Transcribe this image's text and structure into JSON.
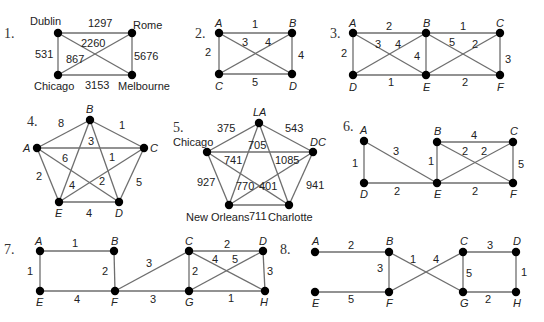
{
  "graphs": [
    {
      "number": "1.",
      "vertices": [
        {
          "id": "Dublin",
          "label": "Dublin",
          "x": 58,
          "y": 33,
          "lx": 30,
          "ly": 25
        },
        {
          "id": "Rome",
          "label": "Rome",
          "x": 132,
          "y": 33,
          "lx": 133,
          "ly": 29
        },
        {
          "id": "Chicago",
          "label": "Chicago",
          "x": 58,
          "y": 75,
          "lx": 34,
          "ly": 90
        },
        {
          "id": "Melbourne",
          "label": "Melbourne",
          "x": 132,
          "y": 75,
          "lx": 118,
          "ly": 90
        }
      ],
      "edges": [
        {
          "from": "Dublin",
          "to": "Rome",
          "weight": "1297",
          "lx": 88,
          "ly": 27
        },
        {
          "from": "Dublin",
          "to": "Chicago",
          "weight": "531",
          "lx": 35,
          "ly": 58
        },
        {
          "from": "Rome",
          "to": "Melbourne",
          "weight": "5676",
          "lx": 134,
          "ly": 60
        },
        {
          "from": "Chicago",
          "to": "Melbourne",
          "weight": "3153",
          "lx": 85,
          "ly": 89
        },
        {
          "from": "Dublin",
          "to": "Melbourne",
          "weight": "2260",
          "lx": 81,
          "ly": 47
        },
        {
          "from": "Rome",
          "to": "Chicago",
          "weight": "867",
          "lx": 66,
          "ly": 63
        }
      ]
    },
    {
      "number": "2.",
      "vertices": [
        {
          "id": "A",
          "label": "A",
          "x": 219,
          "y": 33,
          "lx": 215,
          "ly": 27
        },
        {
          "id": "B",
          "label": "B",
          "x": 292,
          "y": 33,
          "lx": 289,
          "ly": 27
        },
        {
          "id": "C",
          "label": "C",
          "x": 219,
          "y": 74,
          "lx": 215,
          "ly": 90
        },
        {
          "id": "D",
          "label": "D",
          "x": 292,
          "y": 74,
          "lx": 289,
          "ly": 90
        }
      ],
      "edges": [
        {
          "from": "A",
          "to": "B",
          "weight": "1",
          "lx": 252,
          "ly": 28
        },
        {
          "from": "A",
          "to": "C",
          "weight": "2",
          "lx": 205,
          "ly": 56
        },
        {
          "from": "B",
          "to": "D",
          "weight": "4",
          "lx": 298,
          "ly": 59
        },
        {
          "from": "C",
          "to": "D",
          "weight": "5",
          "lx": 252,
          "ly": 86
        },
        {
          "from": "A",
          "to": "D",
          "weight": "3",
          "lx": 242,
          "ly": 46
        },
        {
          "from": "B",
          "to": "C",
          "weight": "4",
          "lx": 265,
          "ly": 46
        }
      ]
    },
    {
      "number": "3.",
      "vertices": [
        {
          "id": "A",
          "label": "A",
          "x": 353,
          "y": 33,
          "lx": 349,
          "ly": 27
        },
        {
          "id": "B",
          "label": "B",
          "x": 426,
          "y": 33,
          "lx": 423,
          "ly": 27
        },
        {
          "id": "C",
          "label": "C",
          "x": 500,
          "y": 33,
          "lx": 496,
          "ly": 27
        },
        {
          "id": "D",
          "label": "D",
          "x": 353,
          "y": 75,
          "lx": 349,
          "ly": 91
        },
        {
          "id": "E",
          "label": "E",
          "x": 426,
          "y": 75,
          "lx": 423,
          "ly": 91
        },
        {
          "id": "F",
          "label": "F",
          "x": 500,
          "y": 75,
          "lx": 497,
          "ly": 91
        }
      ],
      "edges": [
        {
          "from": "A",
          "to": "B",
          "weight": "2",
          "lx": 386,
          "ly": 30
        },
        {
          "from": "B",
          "to": "C",
          "weight": "1",
          "lx": 460,
          "ly": 30
        },
        {
          "from": "A",
          "to": "D",
          "weight": "2",
          "lx": 341,
          "ly": 57
        },
        {
          "from": "B",
          "to": "E",
          "weight": "4",
          "lx": 414,
          "ly": 60
        },
        {
          "from": "C",
          "to": "F",
          "weight": "3",
          "lx": 505,
          "ly": 63
        },
        {
          "from": "D",
          "to": "E",
          "weight": "1",
          "lx": 388,
          "ly": 86
        },
        {
          "from": "E",
          "to": "F",
          "weight": "2",
          "lx": 462,
          "ly": 86
        },
        {
          "from": "A",
          "to": "E",
          "weight": "3",
          "lx": 375,
          "ly": 48
        },
        {
          "from": "D",
          "to": "B",
          "weight": "4",
          "lx": 395,
          "ly": 48
        },
        {
          "from": "B",
          "to": "F",
          "weight": "5",
          "lx": 449,
          "ly": 46
        },
        {
          "from": "E",
          "to": "C",
          "weight": "2",
          "lx": 472,
          "ly": 48
        }
      ]
    },
    {
      "number": "4.",
      "vertices": [
        {
          "id": "B",
          "label": "B",
          "x": 90,
          "y": 120,
          "lx": 86,
          "ly": 113
        },
        {
          "id": "A",
          "label": "A",
          "x": 37,
          "y": 148,
          "lx": 23,
          "ly": 152
        },
        {
          "id": "C",
          "label": "C",
          "x": 144,
          "y": 148,
          "lx": 150,
          "ly": 152
        },
        {
          "id": "E",
          "label": "E",
          "x": 59,
          "y": 202,
          "lx": 55,
          "ly": 217
        },
        {
          "id": "D",
          "label": "D",
          "x": 119,
          "y": 202,
          "lx": 115,
          "ly": 217
        }
      ],
      "edges": [
        {
          "from": "A",
          "to": "B",
          "weight": "8",
          "lx": 58,
          "ly": 127
        },
        {
          "from": "B",
          "to": "C",
          "weight": "1",
          "lx": 119,
          "ly": 129
        },
        {
          "from": "A",
          "to": "C",
          "weight": "6",
          "lx": 62,
          "ly": 162
        },
        {
          "from": "A",
          "to": "E",
          "weight": "2",
          "lx": 36,
          "ly": 180
        },
        {
          "from": "C",
          "to": "D",
          "weight": "5",
          "lx": 136,
          "ly": 186
        },
        {
          "from": "E",
          "to": "D",
          "weight": "4",
          "lx": 86,
          "ly": 217
        },
        {
          "from": "B",
          "to": "E",
          "weight": "4",
          "lx": 69,
          "ly": 189
        },
        {
          "from": "B",
          "to": "D",
          "weight": "3",
          "lx": 88,
          "ly": 145
        },
        {
          "from": "A",
          "to": "D",
          "weight": "2",
          "lx": 99,
          "ly": 185
        },
        {
          "from": "E",
          "to": "C",
          "weight": "1",
          "lx": 109,
          "ly": 161
        }
      ]
    },
    {
      "number": "5.",
      "vertices": [
        {
          "id": "LA",
          "label": "LA",
          "x": 259,
          "y": 123,
          "lx": 253,
          "ly": 116
        },
        {
          "id": "Chicago",
          "label": "Chicago",
          "x": 207,
          "y": 152,
          "lx": 173,
          "ly": 146
        },
        {
          "id": "DC",
          "label": "DC",
          "x": 313,
          "y": 152,
          "lx": 310,
          "ly": 146
        },
        {
          "id": "NewOrleans",
          "label": "New Orleans",
          "x": 229,
          "y": 205,
          "lx": 186,
          "ly": 221
        },
        {
          "id": "Charlotte",
          "label": "Charlotte",
          "x": 289,
          "y": 205,
          "lx": 268,
          "ly": 221
        }
      ],
      "edges": [
        {
          "from": "Chicago",
          "to": "LA",
          "weight": "375",
          "lx": 217,
          "ly": 132
        },
        {
          "from": "LA",
          "to": "DC",
          "weight": "543",
          "lx": 285,
          "ly": 132
        },
        {
          "from": "Chicago",
          "to": "DC",
          "weight": "705",
          "lx": 248,
          "ly": 149
        },
        {
          "from": "Chicago",
          "to": "NewOrleans",
          "weight": "927",
          "lx": 197,
          "ly": 186
        },
        {
          "from": "DC",
          "to": "Charlotte",
          "weight": "941",
          "lx": 306,
          "ly": 189
        },
        {
          "from": "NewOrleans",
          "to": "Charlotte",
          "weight": "711",
          "lx": 249,
          "ly": 220
        },
        {
          "from": "Chicago",
          "to": "Charlotte",
          "weight": "741",
          "lx": 224,
          "ly": 164
        },
        {
          "from": "DC",
          "to": "NewOrleans",
          "weight": "1085",
          "lx": 275,
          "ly": 164
        },
        {
          "from": "LA",
          "to": "NewOrleans",
          "weight": "770",
          "lx": 236,
          "ly": 190
        },
        {
          "from": "LA",
          "to": "Charlotte",
          "weight": "401",
          "lx": 259,
          "ly": 190
        }
      ]
    },
    {
      "number": "6.",
      "vertices": [
        {
          "id": "A",
          "label": "A",
          "x": 364,
          "y": 141,
          "lx": 360,
          "ly": 134
        },
        {
          "id": "B",
          "label": "B",
          "x": 437,
          "y": 142,
          "lx": 434,
          "ly": 135
        },
        {
          "id": "C",
          "label": "C",
          "x": 513,
          "y": 142,
          "lx": 510,
          "ly": 135
        },
        {
          "id": "D",
          "label": "D",
          "x": 364,
          "y": 183,
          "lx": 360,
          "ly": 198
        },
        {
          "id": "E",
          "label": "E",
          "x": 437,
          "y": 183,
          "lx": 434,
          "ly": 198
        },
        {
          "id": "F",
          "label": "F",
          "x": 513,
          "y": 183,
          "lx": 510,
          "ly": 198
        }
      ],
      "edges": [
        {
          "from": "A",
          "to": "D",
          "weight": "1",
          "lx": 352,
          "ly": 167
        },
        {
          "from": "A",
          "to": "E",
          "weight": "3",
          "lx": 393,
          "ly": 155
        },
        {
          "from": "D",
          "to": "E",
          "weight": "2",
          "lx": 394,
          "ly": 195
        },
        {
          "from": "B",
          "to": "E",
          "weight": "1",
          "lx": 428,
          "ly": 165
        },
        {
          "from": "B",
          "to": "C",
          "weight": "4",
          "lx": 471,
          "ly": 139
        },
        {
          "from": "C",
          "to": "F",
          "weight": "5",
          "lx": 518,
          "ly": 168
        },
        {
          "from": "E",
          "to": "F",
          "weight": "2",
          "lx": 472,
          "ly": 195
        },
        {
          "from": "B",
          "to": "F",
          "weight": "2",
          "lx": 462,
          "ly": 155
        },
        {
          "from": "E",
          "to": "C",
          "weight": "2",
          "lx": 481,
          "ly": 155
        }
      ]
    },
    {
      "number": "7.",
      "vertices": [
        {
          "id": "A",
          "label": "A",
          "x": 40,
          "y": 251,
          "lx": 35,
          "ly": 245
        },
        {
          "id": "B",
          "label": "B",
          "x": 114,
          "y": 251,
          "lx": 111,
          "ly": 245
        },
        {
          "id": "C",
          "label": "C",
          "x": 189,
          "y": 251,
          "lx": 185,
          "ly": 245
        },
        {
          "id": "D",
          "label": "D",
          "x": 263,
          "y": 251,
          "lx": 259,
          "ly": 245
        },
        {
          "id": "E",
          "label": "E",
          "x": 40,
          "y": 291,
          "lx": 36,
          "ly": 306
        },
        {
          "id": "F",
          "label": "F",
          "x": 115,
          "y": 291,
          "lx": 111,
          "ly": 306
        },
        {
          "id": "G",
          "label": "G",
          "x": 189,
          "y": 291,
          "lx": 185,
          "ly": 306
        },
        {
          "id": "H",
          "label": "H",
          "x": 265,
          "y": 291,
          "lx": 260,
          "ly": 306
        }
      ],
      "edges": [
        {
          "from": "A",
          "to": "B",
          "weight": "1",
          "lx": 72,
          "ly": 247
        },
        {
          "from": "A",
          "to": "E",
          "weight": "1",
          "lx": 27,
          "ly": 275
        },
        {
          "from": "B",
          "to": "F",
          "weight": "2",
          "lx": 102,
          "ly": 275
        },
        {
          "from": "E",
          "to": "F",
          "weight": "4",
          "lx": 74,
          "ly": 303
        },
        {
          "from": "F",
          "to": "C",
          "weight": "3",
          "lx": 146,
          "ly": 267
        },
        {
          "from": "F",
          "to": "G",
          "weight": "3",
          "lx": 150,
          "ly": 303
        },
        {
          "from": "C",
          "to": "D",
          "weight": "2",
          "lx": 224,
          "ly": 248
        },
        {
          "from": "C",
          "to": "G",
          "weight": "2",
          "lx": 192,
          "ly": 275
        },
        {
          "from": "D",
          "to": "H",
          "weight": "3",
          "lx": 267,
          "ly": 275
        },
        {
          "from": "G",
          "to": "H",
          "weight": "1",
          "lx": 228,
          "ly": 302
        },
        {
          "from": "C",
          "to": "H",
          "weight": "4",
          "lx": 212,
          "ly": 263
        },
        {
          "from": "G",
          "to": "D",
          "weight": "5",
          "lx": 232,
          "ly": 263
        }
      ]
    },
    {
      "number": "8.",
      "vertices": [
        {
          "id": "A",
          "label": "A",
          "x": 315,
          "y": 252,
          "lx": 312,
          "ly": 245
        },
        {
          "id": "B",
          "label": "B",
          "x": 389,
          "y": 252,
          "lx": 386,
          "ly": 245
        },
        {
          "id": "C",
          "label": "C",
          "x": 463,
          "y": 252,
          "lx": 460,
          "ly": 245
        },
        {
          "id": "D",
          "label": "D",
          "x": 516,
          "y": 252,
          "lx": 513,
          "ly": 245
        },
        {
          "id": "E",
          "label": "E",
          "x": 315,
          "y": 292,
          "lx": 312,
          "ly": 307
        },
        {
          "id": "F",
          "label": "F",
          "x": 389,
          "y": 292,
          "lx": 386,
          "ly": 307
        },
        {
          "id": "G",
          "label": "G",
          "x": 463,
          "y": 292,
          "lx": 460,
          "ly": 307
        },
        {
          "id": "H",
          "label": "H",
          "x": 516,
          "y": 292,
          "lx": 513,
          "ly": 307
        }
      ],
      "edges": [
        {
          "from": "A",
          "to": "B",
          "weight": "2",
          "lx": 348,
          "ly": 249
        },
        {
          "from": "B",
          "to": "F",
          "weight": "3",
          "lx": 377,
          "ly": 272
        },
        {
          "from": "E",
          "to": "F",
          "weight": "5",
          "lx": 348,
          "ly": 303
        },
        {
          "from": "B",
          "to": "G",
          "weight": "1",
          "lx": 410,
          "ly": 263
        },
        {
          "from": "F",
          "to": "C",
          "weight": "4",
          "lx": 433,
          "ly": 263
        },
        {
          "from": "C",
          "to": "D",
          "weight": "3",
          "lx": 487,
          "ly": 249
        },
        {
          "from": "C",
          "to": "G",
          "weight": "5",
          "lx": 466,
          "ly": 277
        },
        {
          "from": "D",
          "to": "H",
          "weight": "1",
          "lx": 521,
          "ly": 276
        },
        {
          "from": "G",
          "to": "H",
          "weight": "2",
          "lx": 485,
          "ly": 303
        }
      ]
    }
  ],
  "number_positions": [
    {
      "x": 4,
      "y": 38
    },
    {
      "x": 195,
      "y": 38
    },
    {
      "x": 330,
      "y": 38
    },
    {
      "x": 27,
      "y": 126
    },
    {
      "x": 173,
      "y": 132
    },
    {
      "x": 343,
      "y": 131
    },
    {
      "x": 4,
      "y": 254
    },
    {
      "x": 280,
      "y": 254
    }
  ]
}
